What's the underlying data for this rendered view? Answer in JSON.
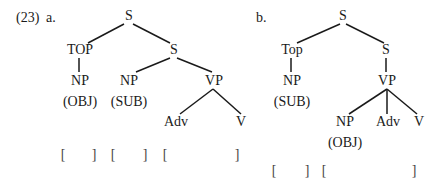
{
  "example_number": "(23)",
  "tree_a": {
    "label": "a.",
    "nodes": {
      "root": "S",
      "top": "TOP",
      "s2": "S",
      "np_top": "NP",
      "np_top_role": "(OBJ)",
      "np_sub": "NP",
      "np_sub_role": "(SUB)",
      "vp": "VP",
      "adv": "Adv",
      "v": "V"
    },
    "brackets": [
      "[",
      "]",
      "[",
      "]",
      "[",
      "]"
    ]
  },
  "tree_b": {
    "label": "b.",
    "nodes": {
      "root": "S",
      "top": "Top",
      "s2": "S",
      "np_top": "NP",
      "np_top_role": "(SUB)",
      "vp": "VP",
      "np_obj": "NP",
      "np_obj_role": "(OBJ)",
      "adv": "Adv",
      "v": "V"
    },
    "brackets": [
      "[",
      "]",
      "[",
      "]"
    ]
  }
}
